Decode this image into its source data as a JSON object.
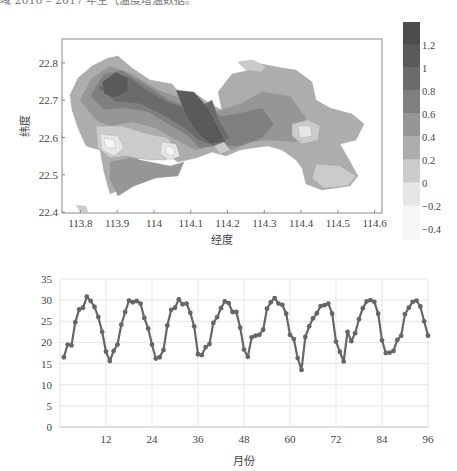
{
  "caption_fragment": "域 2010 – 2017 年空气温度增温数据。",
  "chart_data": [
    {
      "type": "heatmap",
      "title": "",
      "xlabel": "经度",
      "ylabel": "纬度",
      "x_ticks": [
        "113.8",
        "113.9",
        "114",
        "114.1",
        "114.2",
        "114.3",
        "114.4",
        "114.5",
        "114.6"
      ],
      "y_ticks": [
        "22.4",
        "22.5",
        "22.6",
        "22.7",
        "22.8"
      ],
      "xlim": [
        113.75,
        114.62
      ],
      "ylim": [
        22.4,
        22.87
      ],
      "colorbar": {
        "ticks": [
          "1.2",
          "1",
          "0.8",
          "0.6",
          "0.4",
          "0.2",
          "0",
          "-0.2",
          "-0.4"
        ],
        "range": [
          -0.5,
          1.4
        ],
        "levels": [
          {
            "min": -0.5,
            "max": -0.2,
            "color": "#f6f6f6"
          },
          {
            "min": -0.2,
            "max": 0,
            "color": "#e6e6e6"
          },
          {
            "min": 0,
            "max": 0.2,
            "color": "#cbcbcb"
          },
          {
            "min": 0.2,
            "max": 0.4,
            "color": "#adadad"
          },
          {
            "min": 0.4,
            "max": 0.6,
            "color": "#969696"
          },
          {
            "min": 0.6,
            "max": 0.8,
            "color": "#7f7f7f"
          },
          {
            "min": 0.8,
            "max": 1.0,
            "color": "#6b6b6b"
          },
          {
            "min": 1.0,
            "max": 1.2,
            "color": "#5a5a5a"
          },
          {
            "min": 1.2,
            "max": 1.4,
            "color": "#4c4c4c"
          }
        ]
      }
    },
    {
      "type": "line",
      "title": "",
      "xlabel": "月份",
      "ylabel": "",
      "x_ticks": [
        12,
        24,
        36,
        48,
        60,
        72,
        84,
        96
      ],
      "y_ticks": [
        0,
        5,
        10,
        15,
        20,
        25,
        30,
        35
      ],
      "xlim": [
        0,
        96
      ],
      "ylim": [
        0,
        35
      ],
      "grid": true,
      "series": [
        {
          "name": "temperature",
          "color": "#666666",
          "x": [
            1,
            2,
            3,
            4,
            5,
            6,
            7,
            8,
            9,
            10,
            11,
            12,
            13,
            14,
            15,
            16,
            17,
            18,
            19,
            20,
            21,
            22,
            23,
            24,
            25,
            26,
            27,
            28,
            29,
            30,
            31,
            32,
            33,
            34,
            35,
            36,
            37,
            38,
            39,
            40,
            41,
            42,
            43,
            44,
            45,
            46,
            47,
            48,
            49,
            50,
            51,
            52,
            53,
            54,
            55,
            56,
            57,
            58,
            59,
            60,
            61,
            62,
            63,
            64,
            65,
            66,
            67,
            68,
            69,
            70,
            71,
            72,
            73,
            74,
            75,
            76,
            77,
            78,
            79,
            80,
            81,
            82,
            83,
            84,
            85,
            86,
            87,
            88,
            89,
            90,
            91,
            92,
            93,
            94,
            95,
            96
          ],
          "values": [
            16.5,
            19.5,
            19.3,
            24.8,
            27.8,
            28.2,
            30.8,
            29.8,
            28.4,
            26,
            22.5,
            17.8,
            15.6,
            18,
            19.5,
            24.2,
            27.2,
            29.9,
            29.5,
            29.8,
            29.2,
            25.8,
            23.3,
            19.5,
            16.2,
            16.5,
            18.2,
            24,
            27.7,
            28.2,
            30.2,
            29,
            29.2,
            27,
            23.8,
            17.2,
            17,
            18.9,
            19.6,
            24.6,
            26,
            28.1,
            29.7,
            29.3,
            27.2,
            27.2,
            23.5,
            18.3,
            16.6,
            21.2,
            21.6,
            21.8,
            23,
            28,
            29.5,
            30.5,
            29.2,
            28.9,
            26.8,
            21.8,
            20.8,
            16.3,
            13.5,
            21.3,
            23.8,
            25.7,
            26.9,
            28.6,
            28.8,
            29.2,
            26.8,
            20.2,
            17.8,
            15.5,
            22.5,
            20.3,
            22.2,
            25.5,
            28.1,
            29.7,
            30,
            29.6,
            26.8,
            20.5,
            17.5,
            17.6,
            18,
            20.6,
            21.6,
            26.7,
            28.2,
            29.6,
            29.9,
            28.5,
            25,
            21.6,
            18.2
          ]
        }
      ]
    }
  ]
}
